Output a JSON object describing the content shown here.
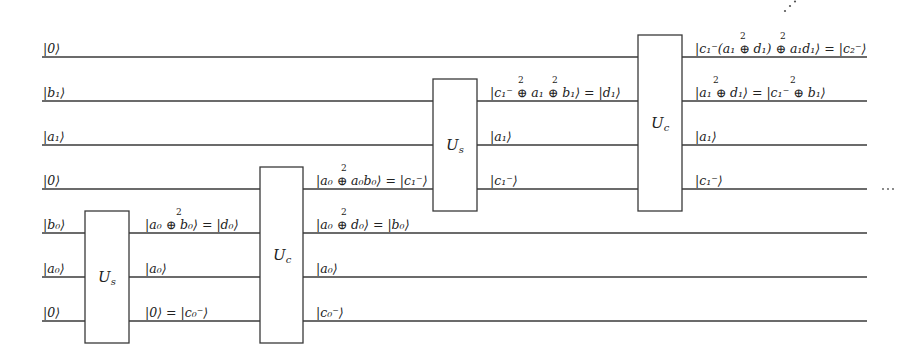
{
  "diagram": {
    "type": "quantum-circuit",
    "wires": [
      {
        "index": 0,
        "input": "|0⟩"
      },
      {
        "index": 1,
        "input": "|b₁⟩"
      },
      {
        "index": 2,
        "input": "|a₁⟩"
      },
      {
        "index": 3,
        "input": "|0⟩"
      },
      {
        "index": 4,
        "input": "|b₀⟩"
      },
      {
        "index": 5,
        "input": "|a₀⟩"
      },
      {
        "index": 6,
        "input": "|0⟩"
      }
    ],
    "gates": [
      {
        "name": "U",
        "sub": "s",
        "wires": [
          4,
          5,
          6
        ]
      },
      {
        "name": "U",
        "sub": "c",
        "wires": [
          3,
          4,
          5,
          6
        ]
      },
      {
        "name": "U",
        "sub": "s",
        "wires": [
          1,
          2,
          3
        ]
      },
      {
        "name": "U",
        "sub": "c",
        "wires": [
          0,
          1,
          2,
          3
        ]
      }
    ],
    "after_gate1": [
      "|a₀ ⊕ b₀⟩ = |d₀⟩",
      "|a₀⟩",
      "|0⟩ = |c₀⁻⟩"
    ],
    "after_gate2": [
      "|a₀ ⊕ a₀b₀⟩ = |c₁⁻⟩",
      "|a₀ ⊕ d₀⟩ = |b₀⟩",
      "|a₀⟩",
      "|c₀⁻⟩"
    ],
    "after_gate3": [
      "|c₁⁻ ⊕ a₁ ⊕ b₁⟩ = |d₁⟩",
      "|a₁⟩",
      "|c₁⁻⟩"
    ],
    "after_gate4": [
      "|c₁⁻(a₁ ⊕ d₁) ⊕ a₁d₁⟩ = |c₂⁻⟩",
      "|a₁ ⊕ d₁⟩ = |c₁⁻ ⊕ b₁⟩",
      "|a₁⟩",
      "|c₁⁻⟩"
    ],
    "oplus_superscript": "2",
    "continuation": "⋯",
    "diagonal_continuation": "⋰"
  }
}
